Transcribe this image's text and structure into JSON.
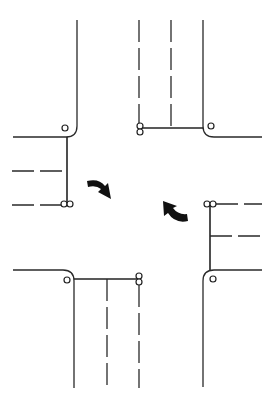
{
  "diagram": {
    "title": "Four-way road intersection with turn arrows",
    "colors": {
      "line": "#2a2a2a",
      "arrow": "#111111",
      "background": "#ffffff"
    },
    "corners": [
      {
        "name": "northwest",
        "signal_heads": 1
      },
      {
        "name": "northeast",
        "signal_heads": 1
      },
      {
        "name": "southeast",
        "signal_heads": 1
      },
      {
        "name": "southwest",
        "signal_heads": 1
      }
    ],
    "approaches": [
      {
        "name": "west-approach",
        "lanes": 2,
        "double_signal": true
      },
      {
        "name": "north-approach",
        "lanes": 2,
        "double_signal": true
      },
      {
        "name": "east-approach",
        "lanes": 2,
        "double_signal": true
      },
      {
        "name": "south-approach",
        "lanes": 2,
        "double_signal": true
      }
    ],
    "arrows": [
      {
        "name": "turn-arrow-west",
        "direction": "curving right/downward"
      },
      {
        "name": "turn-arrow-east",
        "direction": "curving left/upward"
      }
    ]
  }
}
